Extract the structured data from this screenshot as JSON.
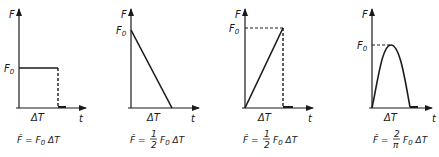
{
  "panels": [
    {
      "name": "rectangular-pulse",
      "y_label": "F",
      "level_label": "F",
      "level_sub": "0",
      "duration_label": "ΔT",
      "x_label": "t",
      "formula_lhs": "F̂ = ",
      "formula_factor": "",
      "formula_rhs": "F",
      "formula_sub": "0",
      "formula_tail": " ΔT"
    },
    {
      "name": "decreasing-triangle-pulse",
      "y_label": "F",
      "level_label": "F",
      "level_sub": "0",
      "duration_label": "ΔT",
      "x_label": "t",
      "formula_lhs": "F̂ = ",
      "frac_num": "1",
      "frac_den": "2",
      "formula_rhs": "F",
      "formula_sub": "0",
      "formula_tail": " ΔT"
    },
    {
      "name": "increasing-triangle-pulse",
      "y_label": "F",
      "level_label": "F",
      "level_sub": "0",
      "duration_label": "ΔT",
      "x_label": "t",
      "formula_lhs": "F̂ = ",
      "frac_num": "1",
      "frac_den": "2",
      "formula_rhs": "F",
      "formula_sub": "0",
      "formula_tail": " ΔT"
    },
    {
      "name": "half-sine-pulse",
      "y_label": "F",
      "level_label": "F",
      "level_sub": "0",
      "duration_label": "ΔT",
      "x_label": "t",
      "formula_lhs": "F̂ = ",
      "frac_num": "2",
      "frac_den": "π",
      "formula_rhs": "F",
      "formula_sub": "0",
      "formula_tail": " ΔT"
    }
  ],
  "colors": {
    "ink": "#1a1a1a",
    "background": "#ffffff"
  }
}
